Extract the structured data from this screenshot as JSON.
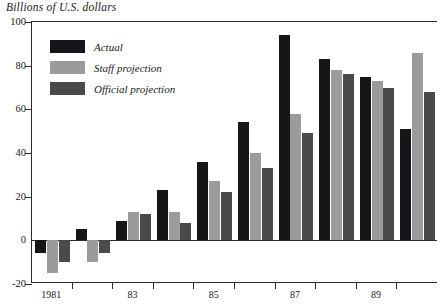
{
  "chart_data": {
    "type": "bar",
    "title": "Billions of U.S. dollars",
    "xlabel": "",
    "ylabel": "Billions of U.S. dollars",
    "ylim": [
      -20,
      100
    ],
    "yticks": [
      -20,
      0,
      20,
      40,
      60,
      80,
      100
    ],
    "ytick_labels": [
      "-20",
      "0",
      "20",
      "40",
      "60",
      "80",
      "100"
    ],
    "grid": false,
    "legend_position": "upper-left-inside",
    "categories": [
      "1981",
      "1982",
      "1983",
      "1984",
      "1985",
      "1986",
      "1987",
      "1988",
      "1989",
      "1990"
    ],
    "tick_labels": [
      "1981",
      "",
      "83",
      "",
      "85",
      "",
      "87",
      "",
      "89",
      ""
    ],
    "series": [
      {
        "name": "Actual",
        "color": "#16161a",
        "values": [
          -6,
          5,
          9,
          23,
          36,
          54,
          94,
          83,
          75,
          51
        ]
      },
      {
        "name": "Staff projection",
        "color": "#9b9b9b",
        "values": [
          -15,
          -10,
          13,
          13,
          27,
          40,
          58,
          78,
          73,
          86
        ]
      },
      {
        "name": "Official projection",
        "color": "#4a4a4a",
        "values": [
          -10,
          -6,
          12,
          8,
          22,
          33,
          49,
          76,
          70,
          68
        ]
      }
    ]
  },
  "legend": {
    "items": [
      {
        "label": "Actual"
      },
      {
        "label": "Staff projection"
      },
      {
        "label": "Official projection"
      }
    ]
  }
}
